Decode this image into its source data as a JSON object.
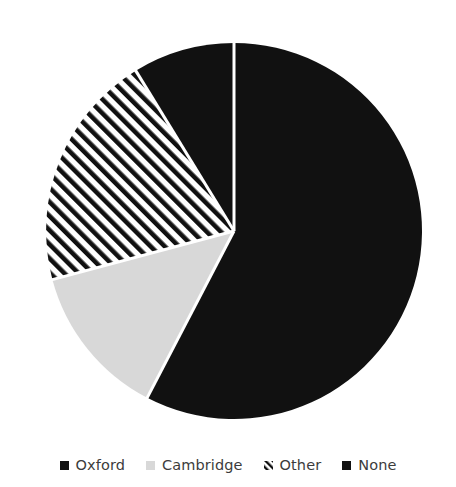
{
  "chart_data": {
    "type": "pie",
    "title": "",
    "subtitle": "",
    "xlabel": "",
    "ylabel": "",
    "grid": false,
    "legend_position": "bottom",
    "start_angle_deg": 0,
    "direction": "clockwise",
    "categories": [
      "Oxford",
      "Cambridge",
      "Other",
      "None"
    ],
    "values": [
      57.6,
      13.2,
      20.4,
      8.8
    ],
    "units": "percent",
    "slices": [
      {
        "label": "Oxford",
        "value": 57.6,
        "start_angle_deg": 0,
        "end_angle_deg": 207.5,
        "sweep_deg": 207.5,
        "fill": "#111111",
        "fill_style": "solid",
        "swatch_style": "solid"
      },
      {
        "label": "Cambridge",
        "value": 13.2,
        "start_angle_deg": 207.5,
        "end_angle_deg": 255.0,
        "sweep_deg": 47.5,
        "fill": "#d8d8d8",
        "fill_style": "solid",
        "swatch_style": "solid"
      },
      {
        "label": "Other",
        "value": 20.4,
        "start_angle_deg": 255.0,
        "end_angle_deg": 328.5,
        "sweep_deg": 73.5,
        "fill": "#ffffff",
        "fill_style": "diagonal-hatch",
        "hatch_color": "#111111",
        "swatch_style": "diagonal-hatch"
      },
      {
        "label": "None",
        "value": 8.8,
        "start_angle_deg": 328.5,
        "end_angle_deg": 360.0,
        "sweep_deg": 31.5,
        "fill": "#111111",
        "fill_style": "solid",
        "swatch_style": "solid"
      }
    ],
    "geometry": {
      "center_x": 234,
      "center_y": 231,
      "radius": 188,
      "separator_color": "#ffffff",
      "separator_width": 3
    },
    "colors": {
      "background": "#ffffff",
      "primary": "#111111",
      "secondary": "#d8d8d8",
      "text": "#3c3c3c"
    }
  },
  "legend": {
    "items": [
      {
        "label": "Oxford",
        "marker": "square-marker-solid-dark"
      },
      {
        "label": "Cambridge",
        "marker": "square-marker-light-gray"
      },
      {
        "label": "Other",
        "marker": "square-marker-diagonal-hatch"
      },
      {
        "label": "None",
        "marker": "square-marker-solid-dark"
      }
    ]
  }
}
